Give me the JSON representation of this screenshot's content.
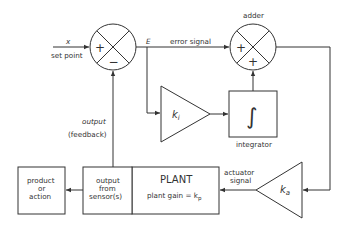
{
  "diagram": {
    "type": "control-loop block diagram",
    "inputs": {
      "x_label": "x",
      "set_point_label": "set point"
    },
    "summer1": {
      "top_left_sign": "+",
      "bottom_sign": "−"
    },
    "summer2": {
      "title": "adder",
      "left_sign": "+",
      "bottom_sign": "+"
    },
    "signals": {
      "E_label": "E",
      "error_signal_label": "error signal",
      "output_label": "output",
      "feedback_label": "(feedback)",
      "actuator_line1": "actuator",
      "actuator_line2": "signal"
    },
    "blocks": {
      "ki": {
        "symbol": "k",
        "subscript": "i"
      },
      "integrator": {
        "symbol": "∫",
        "label": "integrator"
      },
      "ka": {
        "symbol": "k",
        "subscript": "a"
      },
      "plant": {
        "title": "PLANT",
        "gain_text": "plant gain = k",
        "gain_subscript": "p"
      },
      "sensor": {
        "line1": "output",
        "line2": "from",
        "line3": "sensor(s)"
      },
      "product": {
        "line1": "product",
        "line2": "or",
        "line3": "action"
      }
    }
  }
}
